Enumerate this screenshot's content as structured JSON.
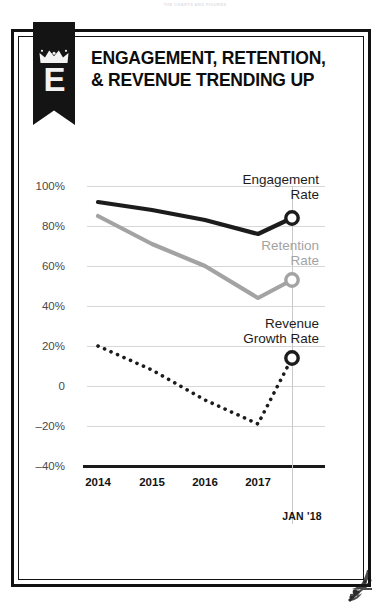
{
  "page": {
    "header_strip_text": "THE CHARTS AND FIGURES"
  },
  "brand": {
    "letter": "E",
    "crown_icon": "crown-icon"
  },
  "headline": {
    "text": "ENGAGEMENT, RETENTION, & REVENUE TRENDING UP"
  },
  "chart_data": {
    "type": "line",
    "title": "ENGAGEMENT, RETENTION, & REVENUE TRENDING UP",
    "xlabel": "",
    "ylabel": "",
    "grid": true,
    "legend_position": "inline-right",
    "ylim": [
      -40,
      105
    ],
    "ytick_labels": [
      "100%",
      "80%",
      "60%",
      "40%",
      "20%",
      "0",
      "-20%",
      "-40%"
    ],
    "ytick_values": [
      100,
      80,
      60,
      40,
      20,
      0,
      -20,
      -40
    ],
    "xtick_labels": [
      "2014",
      "2015",
      "2016",
      "2017"
    ],
    "x": [
      2014,
      2015,
      2016,
      2017,
      2018.05
    ],
    "endpoint_label": "JAN '18",
    "series": [
      {
        "name": "Engagement\nRate",
        "short_name": "Engagement Rate",
        "color": "#1c1c1c",
        "style": "solid",
        "values": [
          92,
          88,
          83,
          76,
          84
        ],
        "endpoint_value": 84,
        "marker": "open-circle"
      },
      {
        "name": "Retention\nRate",
        "short_name": "Retention Rate",
        "color": "#a3a3a3",
        "style": "solid",
        "values": [
          85,
          71,
          60,
          44,
          53
        ],
        "endpoint_value": 53,
        "marker": "open-circle"
      },
      {
        "name": "Revenue\nGrowth Rate",
        "short_name": "Revenue Growth Rate",
        "color": "#1c1c1c",
        "style": "dotted",
        "values": [
          20,
          8,
          -7,
          -19,
          14
        ],
        "endpoint_value": 14,
        "marker": "open-circle"
      }
    ]
  },
  "colors": {
    "ink": "#141414",
    "gray_series": "#a3a3a3",
    "gridline": "#d7d7d7",
    "banner": "#141414"
  }
}
